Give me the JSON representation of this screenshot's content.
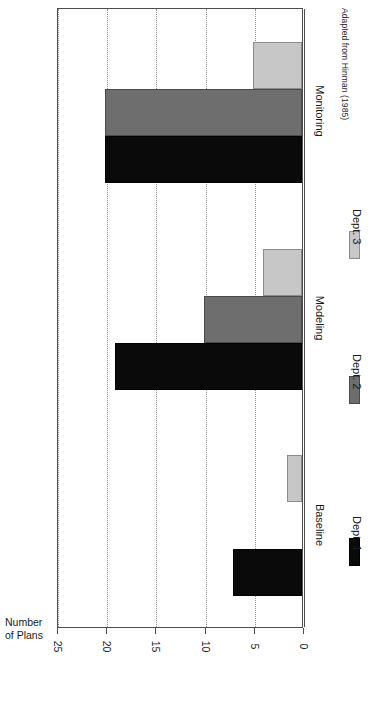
{
  "chart_data": {
    "type": "bar",
    "orientation": "horizontal-rotated",
    "title": "",
    "subtitle": "",
    "xlabel": "",
    "ylabel": "Number\nof Plans",
    "ylabel_line1": "Number",
    "ylabel_line2": "of Plans",
    "categories": [
      "Baseline",
      "Modeling",
      "Monitoring"
    ],
    "series": [
      {
        "name": "Dept. 1",
        "color": "#0a0a0a",
        "values": [
          7,
          19,
          20
        ]
      },
      {
        "name": "Dept. 2",
        "color": "#6e6e6e",
        "values": [
          0,
          10,
          20
        ]
      },
      {
        "name": "Dept. 3",
        "color": "#c7c7c7",
        "values": [
          1.5,
          4,
          5
        ]
      }
    ],
    "ylim": [
      0,
      25
    ],
    "yticks": [
      0,
      5,
      10,
      15,
      20,
      25
    ],
    "ytick_labels": [
      "0",
      "5",
      "10",
      "15",
      "20",
      "25"
    ],
    "grid": true,
    "grid_style": "dotted",
    "legend_position": "right",
    "annotation": "Adapted from Hinman (1985)"
  },
  "axis": {
    "title_line1": "Number",
    "title_line2": "of Plans",
    "ticks": [
      "25",
      "20",
      "15",
      "10",
      "5",
      "0"
    ]
  },
  "categories": [
    {
      "label": "Baseline"
    },
    {
      "label": "Modeling"
    },
    {
      "label": "Monitoring"
    }
  ],
  "legend": {
    "items": [
      {
        "label": "Dept. 1",
        "color": "#0a0a0a"
      },
      {
        "label": "Dept. 2",
        "color": "#6e6e6e"
      },
      {
        "label": "Dept. 3",
        "color": "#c7c7c7"
      }
    ]
  },
  "footer": {
    "attribution": "Adapted from Hinman (1985)"
  },
  "colors": {
    "series_1": "#0a0a0a",
    "series_2": "#6e6e6e",
    "series_3": "#c7c7c7",
    "frame": "#4d4d4d",
    "grid": "#8f8f8f",
    "background": "#ffffff",
    "text": "#1a1a1a"
  }
}
